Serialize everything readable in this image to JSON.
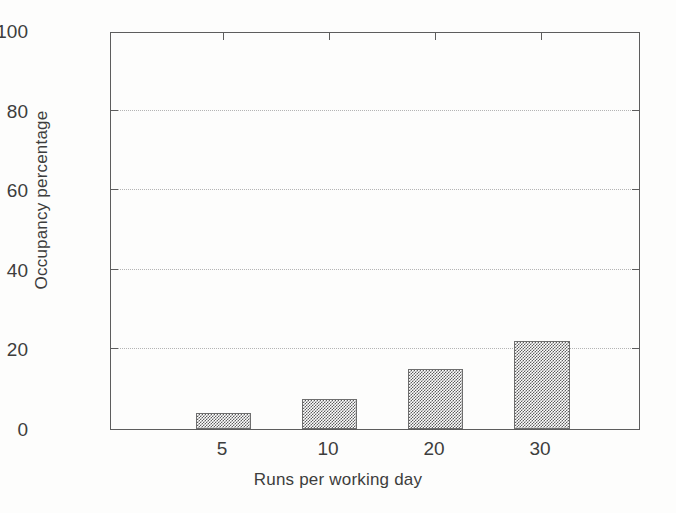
{
  "chart_data": {
    "type": "bar",
    "title": "",
    "xlabel": "Runs per working day",
    "ylabel": "Occupancy percentage",
    "categories": [
      "5",
      "10",
      "20",
      "30"
    ],
    "values": [
      4,
      7.5,
      15,
      22
    ],
    "ylim": [
      0,
      100
    ],
    "yticks": [
      0,
      20,
      40,
      60,
      80,
      100
    ],
    "ytick_labels": [
      "0",
      "20",
      "40",
      "60",
      "80",
      "100"
    ],
    "gridlines_at": [
      20,
      40,
      60,
      80
    ],
    "grid": "horizontal-dotted",
    "legend": "none",
    "bar_color": "#5e5e5e",
    "bar_fill_style": "checkerboard-dither",
    "bar_edge_color": "#6f6f6f",
    "axis_color": "#5d5d5d",
    "grid_color": "#b4b4b4",
    "background": "#fdfdfc",
    "series": [
      {
        "name": "Occupancy percentage",
        "values": [
          4,
          7.5,
          15,
          22
        ]
      }
    ]
  },
  "axis": {
    "y_title": "Occupancy percentage",
    "x_title": "Runs per working day",
    "y_labels": {
      "t0": "0",
      "t20": "20",
      "t40": "40",
      "t60": "60",
      "t80": "80",
      "t100": "100"
    },
    "x_labels": {
      "c0": "5",
      "c1": "10",
      "c2": "20",
      "c3": "30"
    }
  }
}
